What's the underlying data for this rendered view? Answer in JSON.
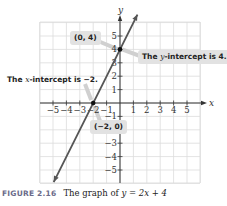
{
  "chart_data": {
    "type": "line",
    "title": "The graph of y = 2x + 4",
    "equation": "y = 2x + 4",
    "xlabel": "x",
    "ylabel": "y",
    "xlim": [
      -5.9,
      5.9
    ],
    "ylim": [
      -5.9,
      5.9
    ],
    "grid": true,
    "x_ticks": [
      -5,
      -4,
      -3,
      -2,
      -1,
      1,
      2,
      3,
      4,
      5
    ],
    "y_ticks": [
      -5,
      -4,
      -3,
      -1,
      1,
      2,
      3,
      4,
      5
    ],
    "x_tick_labels": [
      "−5",
      "−4",
      "−3",
      "−2",
      "−1",
      "1",
      "2",
      "3",
      "4",
      "5"
    ],
    "y_tick_labels": [
      "−5",
      "−4",
      "−3",
      "−1",
      "1",
      "2",
      "3",
      "4",
      "5"
    ],
    "series": [
      {
        "name": "y = 2x + 4",
        "x": [
          -4.95,
          1.3
        ],
        "y": [
          -5.9,
          6.6
        ],
        "color": "#555555"
      }
    ],
    "points": [
      {
        "x": 0,
        "y": 4,
        "label": "(0, 4)"
      },
      {
        "x": -2,
        "y": 0,
        "label": "(−2, 0)"
      }
    ],
    "annotations": [
      {
        "text": "The y-intercept is 4.",
        "target": [
          0,
          4
        ]
      },
      {
        "text": "The x-intercept is −2.",
        "target": [
          -2,
          0
        ]
      },
      {
        "text": "(0, 4)",
        "target": [
          0,
          4
        ]
      },
      {
        "text": "(−2, 0)",
        "target": [
          -2,
          0
        ]
      }
    ]
  },
  "labels": {
    "point_0_4": "(0, 4)",
    "point_neg2_0": "(−2, 0)",
    "y_intercept_pre": "The ",
    "y_intercept_var": "y",
    "y_intercept_post": "-intercept is 4.",
    "x_intercept_pre": "The ",
    "x_intercept_var": "x",
    "x_intercept_post": "-intercept is −2.",
    "axis_x": "x",
    "axis_y": "y"
  },
  "caption": {
    "figure": "FIGURE 2.16",
    "text": "The graph of ",
    "equation": "y = 2x + 4"
  }
}
